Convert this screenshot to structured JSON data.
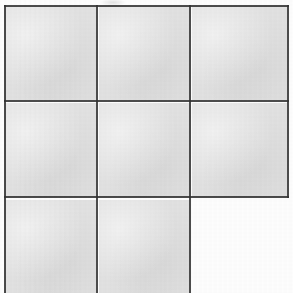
{
  "figure": {
    "background_color": "#ffffff",
    "cell_fill_color": "#e2e2e2",
    "line_color": "#3a3a3a",
    "line_width_px": 2,
    "canvas": {
      "width": 293,
      "height": 293
    },
    "grid": {
      "rows": 3,
      "columns": 3,
      "filled_cell_count": 8,
      "empty_cell_count": 1,
      "column_x_edges": [
        4,
        97,
        190,
        288
      ],
      "row_y_edges": [
        5,
        101,
        198,
        293
      ],
      "bottom_row_clipped": true
    },
    "cells": [
      {
        "id": "cell-r1c1",
        "row": 1,
        "column": 1,
        "state": "filled",
        "x": 5,
        "y": 6,
        "width": 91,
        "height": 94
      },
      {
        "id": "cell-r1c2",
        "row": 1,
        "column": 2,
        "state": "filled",
        "x": 99,
        "y": 6,
        "width": 90,
        "height": 94
      },
      {
        "id": "cell-r1c3",
        "row": 1,
        "column": 3,
        "state": "filled",
        "x": 192,
        "y": 6,
        "width": 95,
        "height": 94
      },
      {
        "id": "cell-r2c1",
        "row": 2,
        "column": 1,
        "state": "filled",
        "x": 5,
        "y": 103,
        "width": 91,
        "height": 94
      },
      {
        "id": "cell-r2c2",
        "row": 2,
        "column": 2,
        "state": "filled",
        "x": 99,
        "y": 103,
        "width": 90,
        "height": 94
      },
      {
        "id": "cell-r2c3",
        "row": 2,
        "column": 3,
        "state": "filled",
        "x": 192,
        "y": 103,
        "width": 95,
        "height": 94
      },
      {
        "id": "cell-r3c1",
        "row": 3,
        "column": 1,
        "state": "filled",
        "x": 5,
        "y": 200,
        "width": 91,
        "height": 93
      },
      {
        "id": "cell-r3c2",
        "row": 3,
        "column": 2,
        "state": "filled",
        "x": 99,
        "y": 200,
        "width": 90,
        "height": 93
      },
      {
        "id": "cell-r3c3",
        "row": 3,
        "column": 3,
        "state": "empty",
        "x": 192,
        "y": 200,
        "width": 101,
        "height": 93
      }
    ],
    "lines": {
      "horizontal": [
        {
          "id": "border-top",
          "y": 5,
          "x_start": 4,
          "x_end": 289
        },
        {
          "id": "divider-row-1-2",
          "y": 101,
          "x_start": 4,
          "x_end": 289
        },
        {
          "id": "divider-row-2-3",
          "y": 197,
          "x_start": 4,
          "x_end": 289
        }
      ],
      "vertical": [
        {
          "id": "border-left",
          "x": 4,
          "y_start": 5,
          "y_end": 293
        },
        {
          "id": "divider-col-1-2",
          "x": 96,
          "y_start": 5,
          "y_end": 293
        },
        {
          "id": "divider-col-2-3",
          "x": 189,
          "y_start": 5,
          "y_end": 293
        },
        {
          "id": "border-right",
          "x": 287,
          "y_start": 5,
          "y_end": 198
        }
      ]
    },
    "artifacts": [
      {
        "id": "top-smudge",
        "x": 100,
        "y": 0,
        "width": 26,
        "height": 6
      }
    ]
  }
}
